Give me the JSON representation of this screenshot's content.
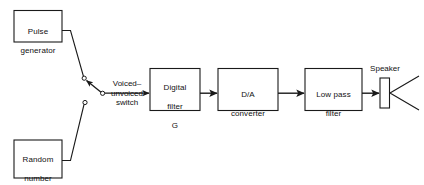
{
  "diagram": {
    "stroke_color": "#1a1a1a",
    "text_color": "#111111",
    "background_color": "#ffffff",
    "blocks": [
      {
        "id": "pulse-generator",
        "lines": "Pulse\ngenerator",
        "line1": "Pulse",
        "line2": "generator"
      },
      {
        "id": "random-number-generator",
        "lines": "Random\nnumber\ngenerator",
        "line1": "Random",
        "line2": "number",
        "line3": "generator"
      },
      {
        "id": "digital-filter",
        "lines": "Digital\nfilter",
        "line1": "Digital",
        "line2": "filter",
        "symbol": "G"
      },
      {
        "id": "da-converter",
        "lines": "D/A\nconverter",
        "line1": "D/A",
        "line2": "converter"
      },
      {
        "id": "low-pass-filter",
        "lines": "Low pass\nfilter",
        "line1": "Low pass",
        "line2": "filter"
      }
    ],
    "switch": {
      "label_line1": "Voiced–",
      "label_line2": "unvoiced",
      "label_line3": "switch",
      "label_full": "Voiced–unvoiced switch"
    },
    "speaker": {
      "label": "Speaker"
    }
  }
}
